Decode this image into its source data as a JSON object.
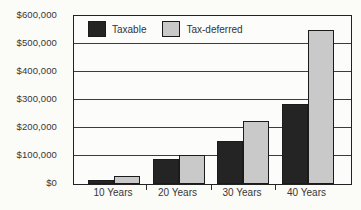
{
  "chart_data": {
    "type": "bar",
    "title": "",
    "categories": [
      "10 Years",
      "20 Years",
      "30 Years",
      "40 Years"
    ],
    "series": [
      {
        "name": "Taxable",
        "color": "#242424",
        "values": [
          15000,
          90000,
          155000,
          285000
        ]
      },
      {
        "name": "Tax-deferred",
        "color": "#c9c9c9",
        "values": [
          30000,
          105000,
          225000,
          550000
        ]
      }
    ],
    "ylim": [
      0,
      600000
    ],
    "ytick_interval": 100000,
    "ytick_labels": [
      "$0",
      "$100,000",
      "$200,000",
      "$300,000",
      "$400,000",
      "$500,000",
      "$600,000"
    ],
    "xlabel": "",
    "ylabel": "",
    "grid": true,
    "legend_position": "top-left-inside",
    "colors": {
      "axis_border": "#222222",
      "gridline": "#3c3c3c",
      "text": "#373737",
      "background": "#fbfbf8"
    }
  }
}
